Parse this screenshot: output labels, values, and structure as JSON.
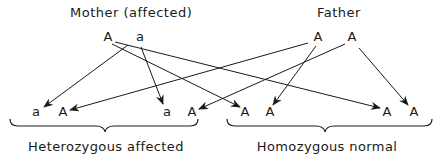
{
  "parents": {
    "mother": {
      "label": "Mother (affected)",
      "alleles": [
        "A",
        "a"
      ]
    },
    "father": {
      "label": "Father",
      "alleles": [
        "A",
        "A"
      ]
    }
  },
  "offspring": [
    {
      "alleles": [
        "a",
        "A"
      ],
      "group": "heterozygous"
    },
    {
      "alleles": [
        "a",
        "A"
      ],
      "group": "heterozygous"
    },
    {
      "alleles": [
        "A",
        "A"
      ],
      "group": "homozygous"
    },
    {
      "alleles": [
        "A",
        "A"
      ],
      "group": "homozygous"
    }
  ],
  "groups": {
    "heterozygous": {
      "label": "Heterozygous affected"
    },
    "homozygous": {
      "label": "Homozygous normal"
    }
  },
  "arrows": [
    {
      "from": "mother.a",
      "to": "offspring.0.a"
    },
    {
      "from": "mother.a",
      "to": "offspring.1.a"
    },
    {
      "from": "mother.A",
      "to": "offspring.2.A1"
    },
    {
      "from": "mother.A",
      "to": "offspring.3.A1"
    },
    {
      "from": "father.A1",
      "to": "offspring.0.A"
    },
    {
      "from": "father.A1",
      "to": "offspring.2.A2"
    },
    {
      "from": "father.A2",
      "to": "offspring.1.A"
    },
    {
      "from": "father.A2",
      "to": "offspring.3.A2"
    }
  ],
  "colors": {
    "ink": "#1a1a1a",
    "background": "#ffffff"
  }
}
